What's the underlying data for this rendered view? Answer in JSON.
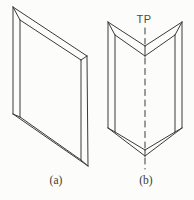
{
  "labels": {
    "twin_plane": "TP",
    "caption_a": "(a)",
    "caption_b": "(b)"
  },
  "colors": {
    "background": "#fcfcfa",
    "line": "#3a3a3a",
    "text": "#3a3a3a"
  },
  "drawing": {
    "stroke_width": 1,
    "figures": [
      {
        "id": "crystal-a",
        "dashed": false,
        "lines": [
          [
            13,
            7,
            87,
            56
          ],
          [
            87,
            56,
            88,
            166
          ],
          [
            88,
            166,
            13,
            114
          ],
          [
            13,
            114,
            13,
            7
          ],
          [
            20,
            20,
            81,
            60
          ],
          [
            81,
            60,
            81,
            160
          ],
          [
            20,
            117,
            81,
            160
          ],
          [
            20,
            20,
            20,
            117
          ],
          [
            13,
            7,
            20,
            20
          ],
          [
            87,
            56,
            81,
            60
          ],
          [
            88,
            166,
            81,
            160
          ],
          [
            13,
            114,
            20,
            117
          ]
        ]
      },
      {
        "id": "crystal-b",
        "dashed": false,
        "lines": [
          [
            108,
            22,
            108,
            128
          ],
          [
            182,
            22,
            182,
            128
          ],
          [
            108,
            22,
            145,
            46
          ],
          [
            182,
            22,
            145,
            46
          ],
          [
            108,
            128,
            145,
            156
          ],
          [
            182,
            128,
            145,
            156
          ],
          [
            115,
            35,
            115,
            132
          ],
          [
            175,
            35,
            175,
            132
          ],
          [
            115,
            35,
            145,
            56
          ],
          [
            175,
            35,
            145,
            56
          ],
          [
            115,
            132,
            145,
            150
          ],
          [
            175,
            132,
            145,
            150
          ],
          [
            108,
            22,
            115,
            35
          ],
          [
            182,
            22,
            175,
            35
          ],
          [
            108,
            128,
            115,
            132
          ],
          [
            182,
            128,
            175,
            132
          ],
          [
            145,
            46,
            145,
            56
          ],
          [
            145,
            150,
            145,
            156
          ]
        ]
      },
      {
        "id": "twin-plane-trace",
        "dashed": true,
        "dash": "6 4.5",
        "lines": [
          [
            145,
            28,
            145,
            44
          ],
          [
            145,
            58,
            145,
            148
          ],
          [
            145,
            158,
            145,
            169
          ]
        ]
      }
    ]
  },
  "text_positions": {
    "twin_plane": {
      "x": 144,
      "y": 23
    },
    "caption_a": {
      "x": 56,
      "y": 184
    },
    "caption_b": {
      "x": 146,
      "y": 184
    }
  }
}
